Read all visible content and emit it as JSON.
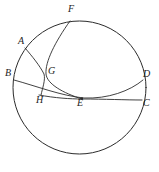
{
  "figure": {
    "kind": "geometry-diagram",
    "stroke_color": "#2b2b2b",
    "background_color": "#ffffff",
    "width": 159,
    "height": 172,
    "circle": {
      "cx": 79.5,
      "cy": 87.5,
      "r": 66.5
    },
    "labels": [
      {
        "id": "A",
        "text": "A",
        "x": 18,
        "y": 36
      },
      {
        "id": "B",
        "text": "B",
        "x": 5,
        "y": 68
      },
      {
        "id": "C",
        "text": "C",
        "x": 143,
        "y": 98
      },
      {
        "id": "D",
        "text": "D",
        "x": 143,
        "y": 69
      },
      {
        "id": "E",
        "text": "E",
        "x": 77,
        "y": 98
      },
      {
        "id": "F",
        "text": "F",
        "x": 68,
        "y": 4
      },
      {
        "id": "G",
        "text": "G",
        "x": 48,
        "y": 66
      },
      {
        "id": "H",
        "text": "H",
        "x": 36,
        "y": 95
      }
    ],
    "points": [
      {
        "id": "A",
        "x": 25,
        "y": 48
      },
      {
        "id": "B",
        "x": 14,
        "y": 80
      },
      {
        "id": "C",
        "x": 142,
        "y": 100
      },
      {
        "id": "D",
        "x": 143,
        "y": 80
      },
      {
        "id": "E",
        "x": 82,
        "y": 99
      },
      {
        "id": "F",
        "x": 70,
        "y": 21
      },
      {
        "id": "G",
        "x": 45,
        "y": 75
      },
      {
        "id": "H",
        "x": 41,
        "y": 95
      }
    ],
    "arcs": [
      {
        "id": "arc-F-G-E",
        "from": "F",
        "to": "E",
        "path": "M 70 21 C 55 42 45 62 46 74 C 47 84 63 93 82 99"
      },
      {
        "id": "arc-A-G-H",
        "from": "A",
        "to": "H",
        "path": "M 25 48 C 32 56 40 66 44 74 C 45.6 80 42.5 88 41 95"
      },
      {
        "id": "arc-B-E-D",
        "from": "B",
        "to": "D",
        "path": "M 14 80 C 36 86 62 96 84 98 C 108 99 130 91 143 80"
      },
      {
        "id": "arc-H-E-C",
        "from": "H",
        "to": "C",
        "path": "M 39 95 C 55 98 70 99 82 99 C 104 99 126 100 142 100"
      }
    ]
  }
}
